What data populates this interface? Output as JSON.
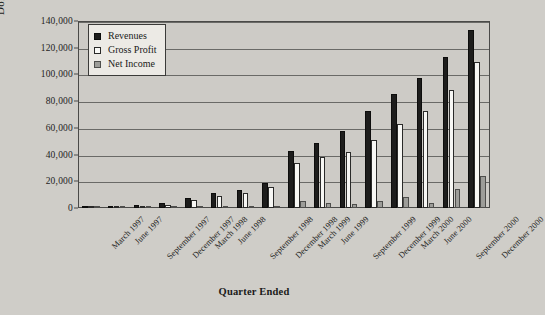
{
  "chart_data": {
    "type": "bar",
    "title": "",
    "xlabel": "Quarter Ended",
    "ylabel": "Dollars (000's)",
    "ylim": [
      0,
      140000
    ],
    "ytick_step": 20000,
    "grid": true,
    "legend_position": "top-left-inside",
    "categories": [
      "March 1997",
      "June 1997",
      "September 1997",
      "December 1997",
      "March 1998",
      "June 1998",
      "September 1998",
      "December 1998",
      "March 1999",
      "June 1999",
      "September 1999",
      "December 1999",
      "March 2000",
      "June 2000",
      "September 2000",
      "December 2000"
    ],
    "ytick_labels": [
      "0",
      "20,000",
      "40,000",
      "60,000",
      "80,000",
      "100,000",
      "120,000",
      "140,000"
    ],
    "ytick_values": [
      0,
      20000,
      40000,
      60000,
      80000,
      100000,
      120000,
      140000
    ],
    "series": [
      {
        "name": "Revenues",
        "color": "#1d1d1c",
        "values": [
          1000,
          1500,
          2500,
          4000,
          7500,
          11000,
          13500,
          19000,
          43000,
          49000,
          58000,
          73000,
          85000,
          97000,
          113000,
          133000
        ]
      },
      {
        "name": "Gross Profit",
        "color": "#f7f7f4",
        "values": [
          500,
          800,
          1300,
          2500,
          6000,
          9000,
          11500,
          16000,
          34000,
          38000,
          42000,
          51000,
          63000,
          73000,
          88000,
          109000
        ]
      },
      {
        "name": "Net Income",
        "color": "#9d9d99",
        "values": [
          200,
          200,
          300,
          300,
          500,
          500,
          800,
          1000,
          5000,
          4000,
          3000,
          5500,
          8500,
          4000,
          14000,
          24000
        ]
      }
    ]
  },
  "legend": {
    "items": [
      {
        "label": "Revenues",
        "swatch": "black-square-icon"
      },
      {
        "label": "Gross Profit",
        "swatch": "white-square-icon"
      },
      {
        "label": "Net Income",
        "swatch": "gray-square-icon"
      }
    ]
  },
  "axes": {
    "y_title": "Dollars (000's)",
    "x_title": "Quarter Ended"
  }
}
